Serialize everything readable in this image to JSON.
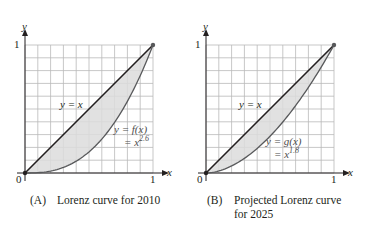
{
  "figure": {
    "panels": [
      {
        "id": "A",
        "caption_tag": "(A)",
        "caption_line1": "Lorenz curve for 2010",
        "caption_line2": "",
        "axis_x_label": "x",
        "axis_y_label": "y",
        "tick_origin": "0",
        "tick_x_one": "1",
        "tick_y_one": "1",
        "line_label": "y = x",
        "curve_label_line1": "y = f(x)",
        "curve_label_line2_prefix": "= x",
        "curve_exponent": "2.6"
      },
      {
        "id": "B",
        "caption_tag": "(B)",
        "caption_line1": "Projected Lorenz curve",
        "caption_line2": "for 2025",
        "axis_x_label": "x",
        "axis_y_label": "y",
        "tick_origin": "0",
        "tick_x_one": "1",
        "tick_y_one": "1",
        "line_label": "y = x",
        "curve_label_line1": "y = g(x)",
        "curve_label_line2_prefix": "= x",
        "curve_exponent": "1.8"
      }
    ],
    "colors": {
      "grid": "#b9b9b9",
      "axis": "#231f20",
      "diagonal": "#231f20",
      "curve": "#58595b",
      "shade": "#dcdcdc"
    },
    "grid_divisions": 10
  },
  "chart_data": [
    {
      "type": "line",
      "title": "Lorenz curve for 2010",
      "xlabel": "x",
      "ylabel": "y",
      "xlim": [
        0,
        1
      ],
      "ylim": [
        0,
        1
      ],
      "grid": true,
      "series": [
        {
          "name": "y = x",
          "function": "x"
        },
        {
          "name": "y = f(x) = x^2.6",
          "function": "x^2.6"
        }
      ],
      "shaded_region": "between y = x and y = x^2.6"
    },
    {
      "type": "line",
      "title": "Projected Lorenz curve for 2025",
      "xlabel": "x",
      "ylabel": "y",
      "xlim": [
        0,
        1
      ],
      "ylim": [
        0,
        1
      ],
      "grid": true,
      "series": [
        {
          "name": "y = x",
          "function": "x"
        },
        {
          "name": "y = g(x) = x^1.8",
          "function": "x^1.8"
        }
      ],
      "shaded_region": "between y = x and y = x^1.8"
    }
  ]
}
